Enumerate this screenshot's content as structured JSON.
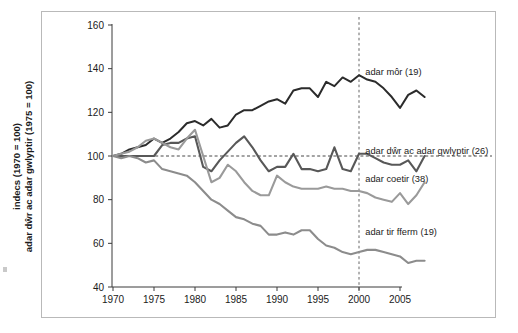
{
  "figure": {
    "width": 518,
    "height": 333,
    "background": "#ffffff",
    "frame_border_color": "#b9b9b9"
  },
  "axis_titles": {
    "y_line1": "indecs (1970 = 100)",
    "y_line2": "adar dŵr ac adar gwlyptir (1975 = 100)",
    "x": ""
  },
  "chart_data": {
    "type": "line",
    "title": "",
    "xlabel": "",
    "ylabel": "indecs (1970 = 100) / adar dŵr ac adar gwlyptir (1975 = 100)",
    "xlim": [
      1969,
      2009
    ],
    "ylim": [
      40,
      160
    ],
    "xticks": [
      1970,
      1975,
      1980,
      1985,
      1990,
      1995,
      2000,
      2005
    ],
    "xticklabels": [
      "1970",
      "1975",
      "1980",
      "1985",
      "1990",
      "1995",
      "2000",
      "2005"
    ],
    "yticks": [
      40,
      60,
      80,
      100,
      120,
      140,
      160
    ],
    "yticklabels": [
      "40",
      "60",
      "80",
      "100",
      "120",
      "140",
      "160"
    ],
    "grid": false,
    "legend_position": "inline-right-of-series",
    "reference_lines": [
      {
        "name": "baseline-100",
        "orientation": "horizontal",
        "value": 100,
        "style": "dashed",
        "color": "#333333"
      },
      {
        "name": "year-2000",
        "orientation": "vertical",
        "value": 2000,
        "style": "dashed",
        "color": "#555555"
      }
    ],
    "x": [
      1970,
      1971,
      1972,
      1973,
      1974,
      1975,
      1976,
      1977,
      1978,
      1979,
      1980,
      1981,
      1982,
      1983,
      1984,
      1985,
      1986,
      1987,
      1988,
      1989,
      1990,
      1991,
      1992,
      1993,
      1994,
      1995,
      1996,
      1997,
      1998,
      1999,
      2000,
      2001,
      2002,
      2003,
      2004,
      2005,
      2006,
      2007,
      2008
    ],
    "series": [
      {
        "name": "adar môr (19)",
        "label": "adar môr (19)",
        "count": 19,
        "color": "#2b2b2b",
        "width": 2.0,
        "label_x": 2000.4,
        "label_y": 137,
        "values": [
          100,
          101,
          103,
          104,
          105,
          108,
          106,
          108,
          111,
          115,
          116,
          114,
          117,
          113,
          114,
          119,
          121,
          121,
          123,
          125,
          126,
          124,
          130,
          131,
          131,
          127,
          134,
          132,
          136,
          134,
          137,
          135,
          134,
          131,
          127,
          122,
          128,
          130,
          127
        ]
      },
      {
        "name": "adar dŵr ac adar gwlyptir (26)",
        "label": "adar dŵr ac adar gwlyptir (26)",
        "count": 26,
        "color": "#585858",
        "width": 2.1,
        "label_x": 2000.4,
        "label_y": 101,
        "values": [
          100,
          100,
          100,
          100,
          100,
          100,
          105,
          106,
          106,
          108,
          109,
          95,
          93,
          98,
          102,
          106,
          109,
          104,
          98,
          93,
          95,
          95,
          101,
          94,
          94,
          93,
          94,
          104,
          94,
          93,
          101,
          101,
          99,
          97,
          96,
          96,
          98,
          93,
          100
        ]
      },
      {
        "name": "adar coetir (38)",
        "label": "adar coetir (38)",
        "count": 38,
        "color": "#9a9a9a",
        "width": 2.1,
        "label_x": 2000.4,
        "label_y": 88,
        "values": [
          100,
          101,
          102,
          104,
          107,
          108,
          106,
          104,
          103,
          108,
          112,
          100,
          88,
          90,
          96,
          93,
          88,
          84,
          82,
          82,
          91,
          88,
          86,
          85,
          85,
          85,
          86,
          85,
          85,
          84,
          84,
          83,
          81,
          80,
          79,
          83,
          78,
          82,
          88
        ]
      },
      {
        "name": "adar tir fferm (19)",
        "label": "adar tir fferm (19)",
        "count": 19,
        "color": "#8c8c8c",
        "width": 2.1,
        "label_x": 2000.4,
        "label_y": 64,
        "values": [
          100,
          99,
          100,
          99,
          97,
          98,
          94,
          93,
          92,
          91,
          88,
          84,
          80,
          78,
          75,
          72,
          71,
          69,
          68,
          64,
          64,
          65,
          64,
          66,
          66,
          62,
          59,
          58,
          56,
          55,
          56,
          57,
          57,
          56,
          55,
          54,
          51,
          52,
          52
        ]
      }
    ]
  }
}
